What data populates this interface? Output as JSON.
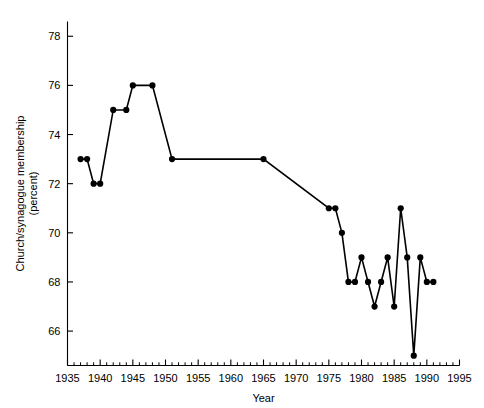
{
  "chart_data": {
    "type": "line",
    "title": "",
    "xlabel": "Year",
    "ylabel": "Church/synagogue membership (percent)",
    "ylabel_line1": "Church/synagogue membership",
    "ylabel_line2": "(percent)",
    "xlim": [
      1935,
      1995
    ],
    "ylim": [
      64.6,
      78.6
    ],
    "grid": false,
    "legend": null,
    "x_major_ticks": [
      1935,
      1940,
      1945,
      1950,
      1955,
      1960,
      1965,
      1970,
      1975,
      1980,
      1985,
      1990,
      1995
    ],
    "x_major_tick_labels": [
      "1935",
      "1940",
      "1945",
      "1950",
      "1955",
      "1960",
      "1965",
      "1970",
      "1975",
      "1980",
      "1985",
      "1990",
      "1995"
    ],
    "x_minor_tick_step": 1,
    "y_major_ticks": [
      66,
      68,
      70,
      72,
      74,
      76,
      78
    ],
    "y_major_tick_labels": [
      "66",
      "68",
      "70",
      "72",
      "74",
      "76",
      "78"
    ],
    "series": [
      {
        "name": "Church/synagogue membership",
        "color": "#000000",
        "marker": "circle",
        "x": [
          1937,
          1938,
          1939,
          1940,
          1942,
          1944,
          1945,
          1948,
          1951,
          1965,
          1975,
          1976,
          1977,
          1978,
          1979,
          1980,
          1981,
          1982,
          1983,
          1984,
          1985,
          1986,
          1987,
          1988,
          1989,
          1990,
          1991
        ],
        "y": [
          73,
          73,
          72,
          72,
          75,
          75,
          76,
          76,
          73,
          73,
          71,
          71,
          70,
          68,
          68,
          69,
          68,
          67,
          68,
          69,
          67,
          71,
          69,
          65,
          69,
          68,
          68
        ],
        "values": [
          {
            "year": 1937,
            "percent": 73
          },
          {
            "year": 1938,
            "percent": 73
          },
          {
            "year": 1939,
            "percent": 72
          },
          {
            "year": 1940,
            "percent": 72
          },
          {
            "year": 1942,
            "percent": 75
          },
          {
            "year": 1944,
            "percent": 75
          },
          {
            "year": 1945,
            "percent": 76
          },
          {
            "year": 1948,
            "percent": 76
          },
          {
            "year": 1951,
            "percent": 73
          },
          {
            "year": 1965,
            "percent": 73
          },
          {
            "year": 1975,
            "percent": 71
          },
          {
            "year": 1976,
            "percent": 71
          },
          {
            "year": 1977,
            "percent": 70
          },
          {
            "year": 1978,
            "percent": 68
          },
          {
            "year": 1979,
            "percent": 68
          },
          {
            "year": 1980,
            "percent": 69
          },
          {
            "year": 1981,
            "percent": 68
          },
          {
            "year": 1982,
            "percent": 67
          },
          {
            "year": 1983,
            "percent": 68
          },
          {
            "year": 1984,
            "percent": 69
          },
          {
            "year": 1985,
            "percent": 67
          },
          {
            "year": 1986,
            "percent": 71
          },
          {
            "year": 1987,
            "percent": 69
          },
          {
            "year": 1988,
            "percent": 65
          },
          {
            "year": 1989,
            "percent": 69
          },
          {
            "year": 1990,
            "percent": 68
          },
          {
            "year": 1991,
            "percent": 68
          }
        ]
      }
    ]
  }
}
